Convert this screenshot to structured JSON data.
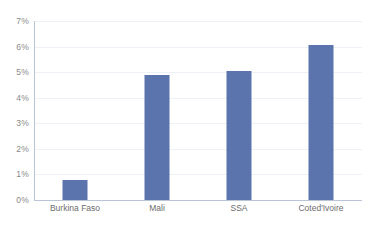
{
  "chart_data": {
    "type": "bar",
    "title": "",
    "subtitle": "",
    "xlabel": "",
    "ylabel": "",
    "categories": [
      "Burkina Faso",
      "Mali",
      "SSA",
      "Coted'Ivoire"
    ],
    "values": [
      0.8,
      4.9,
      5.05,
      6.05
    ],
    "value_suffix": "%",
    "ylim": [
      0,
      7
    ],
    "ytick_step": 1,
    "ytick_labels": [
      "0%",
      "1%",
      "2%",
      "3%",
      "4%",
      "5%",
      "6%",
      "7%"
    ],
    "grid": true,
    "grid_axis": "y",
    "legend": false,
    "legend_position": "none",
    "series": [
      {
        "name": "",
        "values": [
          0.8,
          4.9,
          5.05,
          6.05
        ]
      }
    ],
    "colors": {
      "bar": "#5b74ae",
      "gridline": "#eef1f5",
      "axis_line": "#b9c4d6",
      "ytick_text": "#8a8a8a",
      "xtick_text": "#6d6d6d",
      "background": "#ffffff"
    }
  }
}
